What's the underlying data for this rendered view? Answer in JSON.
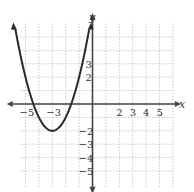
{
  "chart_data": {
    "type": "line",
    "title": "",
    "xlabel": "x",
    "ylabel": "y",
    "xlim": [
      -6,
      6
    ],
    "ylim": [
      -6,
      6
    ],
    "grid": true,
    "x_tick_labels": [
      "-5",
      "-3",
      "2",
      "3",
      "4",
      "5"
    ],
    "y_tick_labels": [
      "3",
      "2",
      "-2",
      "-3",
      "-4",
      "-5"
    ],
    "series": [
      {
        "name": "parabola",
        "equation": "y = (x + 3)^2 - 2",
        "vertex": [
          -3,
          -2
        ],
        "x_intercepts": [
          -4.41,
          -1.59
        ],
        "x": [
          -5.75,
          -5,
          -4.41,
          -4,
          -3,
          -2,
          -1.59,
          -1,
          -0.25
        ],
        "values": [
          5.56,
          2,
          0,
          -1,
          -2,
          -1,
          0,
          2,
          5.56
        ]
      }
    ]
  },
  "labels": {
    "x_axis": "x",
    "y_axis": "y",
    "ticks_x": [
      {
        "text": "-5",
        "v": -5
      },
      {
        "text": "-3",
        "v": -3
      },
      {
        "text": "2",
        "v": 2
      },
      {
        "text": "3",
        "v": 3
      },
      {
        "text": "4",
        "v": 4
      },
      {
        "text": "5",
        "v": 5
      }
    ],
    "ticks_y": [
      {
        "text": "3",
        "v": 3
      },
      {
        "text": "2",
        "v": 2
      },
      {
        "text": "-2",
        "v": -2
      },
      {
        "text": "-3",
        "v": -3
      },
      {
        "text": "-4",
        "v": -4
      },
      {
        "text": "-5",
        "v": -5
      }
    ]
  }
}
